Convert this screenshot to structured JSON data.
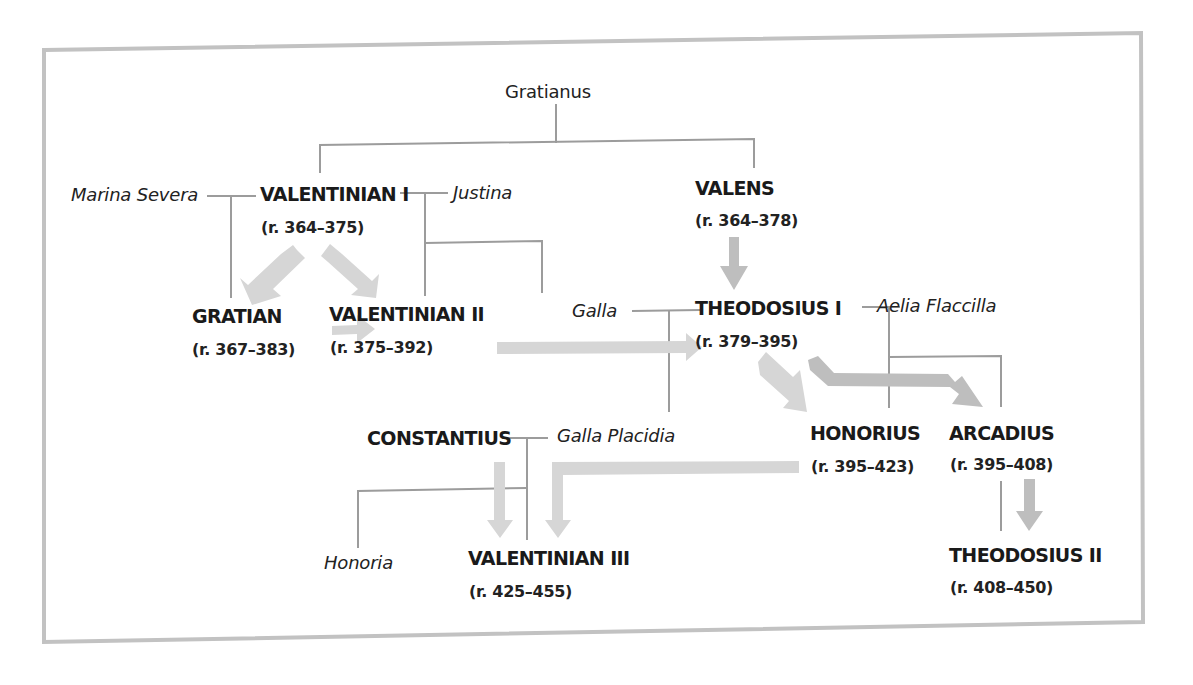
{
  "diagram": {
    "colors": {
      "border": "#bdbdbd",
      "family_line": "#9a9a9a",
      "arrow_light": "#d6d6d6",
      "arrow_dark": "#bebebe",
      "text": "#1d1d1d"
    },
    "people": {
      "gratianus": {
        "name": "Gratianus"
      },
      "marina_severa": {
        "name": "Marina Severa"
      },
      "valentinian1": {
        "name": "VALENTINIAN I",
        "reign": "(r. 364–375)"
      },
      "justina": {
        "name": "Justina"
      },
      "valens": {
        "name": "VALENS",
        "reign": "(r. 364–378)"
      },
      "gratian": {
        "name": "GRATIAN",
        "reign": "(r. 367–383)"
      },
      "valentinian2": {
        "name": "VALENTINIAN II",
        "reign": "(r. 375–392)"
      },
      "galla": {
        "name": "Galla"
      },
      "theodosius1": {
        "name": "THEODOSIUS I",
        "reign": "(r. 379–395)"
      },
      "aelia_flaccilla": {
        "name": "Aelia Flaccilla"
      },
      "constantius": {
        "name": "CONSTANTIUS"
      },
      "galla_placidia": {
        "name": "Galla Placidia"
      },
      "honorius": {
        "name": "HONORIUS",
        "reign": "(r. 395–423)"
      },
      "arcadius": {
        "name": "ARCADIUS",
        "reign": "(r. 395–408)"
      },
      "honoria": {
        "name": "Honoria"
      },
      "valentinian3": {
        "name": "VALENTINIAN III",
        "reign": "(r. 425–455)"
      },
      "theodosius2": {
        "name": "THEODOSIUS II",
        "reign": "(r. 408–450)"
      }
    },
    "succession_arrows": [
      {
        "from": "VALENTINIAN I",
        "to": "GRATIAN"
      },
      {
        "from": "VALENTINIAN I",
        "to": "VALENTINIAN II"
      },
      {
        "from": "GRATIAN",
        "to": "VALENTINIAN II"
      },
      {
        "from": "VALENS",
        "to": "THEODOSIUS I"
      },
      {
        "from": "VALENTINIAN II",
        "to": "THEODOSIUS I"
      },
      {
        "from": "THEODOSIUS I",
        "to": "HONORIUS"
      },
      {
        "from": "THEODOSIUS I",
        "to": "ARCADIUS"
      },
      {
        "from": "CONSTANTIUS",
        "to": "VALENTINIAN III"
      },
      {
        "from": "HONORIUS",
        "to": "VALENTINIAN III"
      },
      {
        "from": "ARCADIUS",
        "to": "THEODOSIUS II"
      }
    ],
    "marriages": [
      [
        "Marina Severa",
        "VALENTINIAN I"
      ],
      [
        "VALENTINIAN I",
        "Justina"
      ],
      [
        "Galla",
        "THEODOSIUS I"
      ],
      [
        "THEODOSIUS I",
        "Aelia Flaccilla"
      ],
      [
        "CONSTANTIUS",
        "Galla Placidia"
      ]
    ]
  }
}
